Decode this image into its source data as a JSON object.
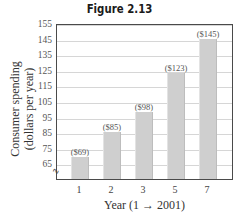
{
  "figure": {
    "title": "Figure 2.13"
  },
  "chart_data": {
    "type": "bar",
    "title": "Figure 2.13",
    "xlabel": "Year (1 → 2001)",
    "ylabel": "Consumer spending (dollars per year)",
    "ylabel_lines": [
      "Consumer spending",
      "(dollars per year)"
    ],
    "categories": [
      "1",
      "2",
      "3",
      "5",
      "7"
    ],
    "values": [
      69,
      85,
      98,
      123,
      145
    ],
    "data_labels": [
      "($69)",
      "($85)",
      "($98)",
      "($123)",
      "($145)"
    ],
    "yticks": [
      "155",
      "145",
      "135",
      "125",
      "115",
      "105",
      "95",
      "85",
      "75",
      "65"
    ],
    "ylim": [
      55,
      155
    ],
    "grid": true,
    "axis_break": true,
    "bar_color": "#cfcfcf"
  }
}
